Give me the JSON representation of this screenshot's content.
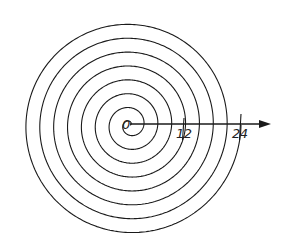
{
  "diagram": {
    "type": "archimedean-spiral",
    "center": [
      130,
      125
    ],
    "turns": 8,
    "end_radius": 111,
    "stroke_color": "#1a1a1a",
    "axis": {
      "start_x": 130,
      "end_x": 271,
      "y": 124
    },
    "labels": [
      {
        "text": "0",
        "x": 122,
        "y": 118
      },
      {
        "text": "12",
        "x": 176,
        "y": 127
      },
      {
        "text": "24",
        "x": 232,
        "y": 127
      }
    ],
    "ticks": [
      {
        "x": 184,
        "y1": 118,
        "y2": 140
      },
      {
        "x": 241,
        "y1": 114,
        "y2": 140
      }
    ]
  }
}
